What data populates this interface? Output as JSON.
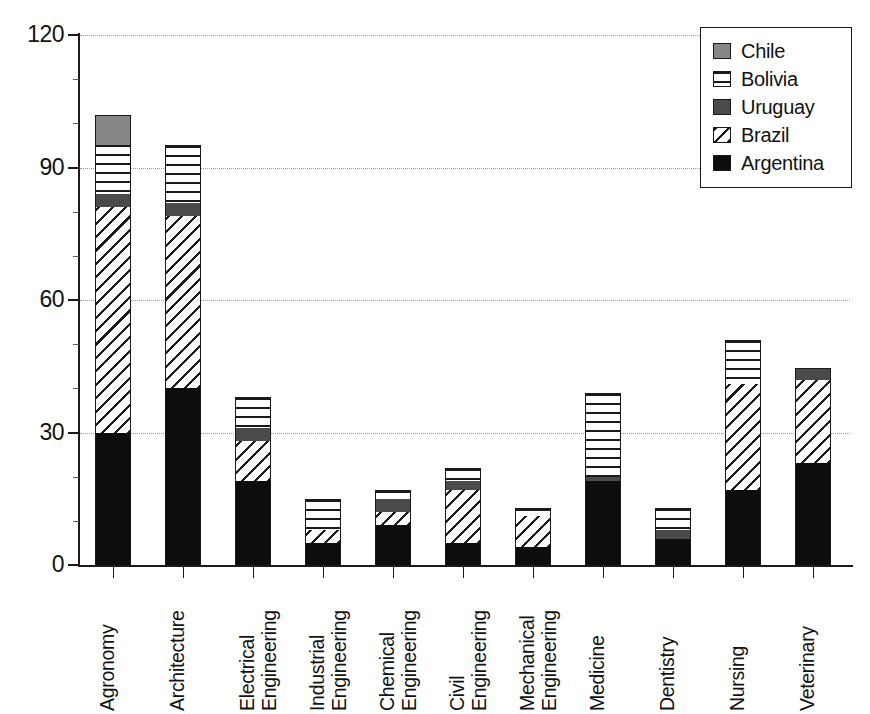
{
  "chart_data": {
    "type": "bar",
    "subtype": "stacked-vertical",
    "title": "",
    "xlabel": "",
    "ylabel": "",
    "ylim": [
      0,
      120
    ],
    "yticks": [
      0,
      30,
      60,
      90,
      120
    ],
    "ytick_labels": [
      "0",
      "30",
      "60",
      "90",
      "120"
    ],
    "y_minor_interval": 10,
    "grid": "horizontal-dotted",
    "legend_position": "top-right",
    "categories": [
      "Agronomy",
      "Architecture",
      "Electrical Engineering",
      "Industrial Engineering",
      "Chemical Engineering",
      "Civil Engineering",
      "Mechanical Engineering",
      "Medicine",
      "Dentistry",
      "Nursing",
      "Veterinary"
    ],
    "category_lines": [
      [
        "Agronomy"
      ],
      [
        "Architecture"
      ],
      [
        "Electrical",
        "Engineering"
      ],
      [
        "Industrial",
        "Engineering"
      ],
      [
        "Chemical",
        "Engineering"
      ],
      [
        "Civil",
        "Engineering"
      ],
      [
        "Mechanical",
        "Engineering"
      ],
      [
        "Medicine"
      ],
      [
        "Dentistry"
      ],
      [
        "Nursing"
      ],
      [
        "Veterinary"
      ]
    ],
    "stack_order": [
      "Argentina",
      "Brazil",
      "Uruguay",
      "Bolivia",
      "Chile"
    ],
    "series": [
      {
        "name": "Argentina",
        "pattern": "solid-black",
        "color": "#0d0d0d",
        "values": [
          30,
          40,
          19,
          5,
          9,
          5,
          4,
          19,
          6,
          17,
          23
        ]
      },
      {
        "name": "Brazil",
        "pattern": "diagonal-hatch",
        "color": "#ffffff",
        "values": [
          51,
          39,
          9,
          3,
          3,
          12,
          7,
          0,
          0,
          24,
          19
        ]
      },
      {
        "name": "Uruguay",
        "pattern": "solid-dark-gray",
        "color": "#4a4a4a",
        "values": [
          3,
          3,
          3,
          0,
          3,
          2,
          0,
          1,
          2,
          0,
          2.5
        ]
      },
      {
        "name": "Bolivia",
        "pattern": "horizontal-lines",
        "color": "#ffffff",
        "values": [
          11,
          13,
          7,
          7,
          2,
          3,
          2,
          19,
          5,
          10,
          0
        ]
      },
      {
        "name": "Chile",
        "pattern": "solid-mid-gray",
        "color": "#878787",
        "values": [
          7,
          0,
          0,
          0,
          0,
          0,
          0,
          0,
          0,
          0,
          0
        ]
      }
    ],
    "totals": [
      102,
      95,
      38,
      15,
      17,
      22,
      13,
      39,
      13,
      51,
      44.5
    ]
  },
  "legend": {
    "entries": [
      {
        "label": "Chile",
        "swatch": "solid-mid-gray"
      },
      {
        "label": "Bolivia",
        "swatch": "horizontal-lines"
      },
      {
        "label": "Uruguay",
        "swatch": "solid-dark-gray"
      },
      {
        "label": "Brazil",
        "swatch": "diagonal-hatch"
      },
      {
        "label": "Argentina",
        "swatch": "solid-black"
      }
    ]
  }
}
